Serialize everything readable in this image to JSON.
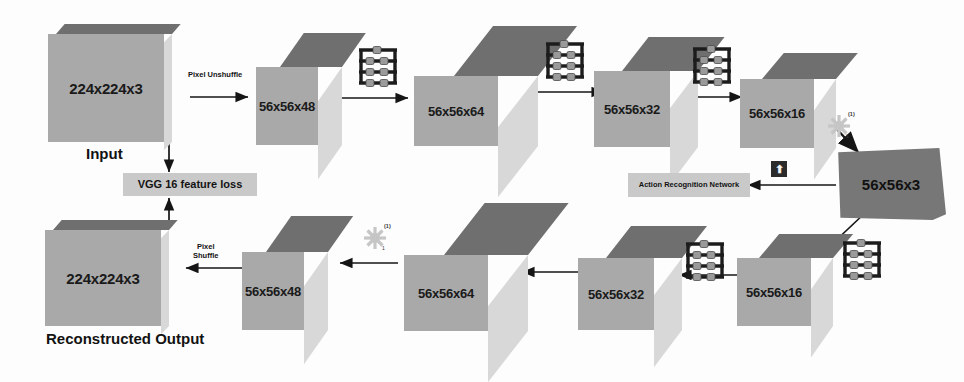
{
  "diagram": {
    "colors": {
      "cube_front": "#a9a9a9",
      "cube_top": "#6f6f6f",
      "cube_side": "#d8d8d8",
      "plate_fill": "#777777",
      "label_fill": "#c9c9c9",
      "ink": "#121212",
      "page": "#fdfdfd"
    },
    "encoder_row": {
      "blocks": [
        {
          "label": "224x224x3",
          "caption": "Input"
        },
        {
          "label": "56x56x48"
        },
        {
          "label": "56x56x64"
        },
        {
          "label": "56x56x32"
        },
        {
          "label": "56x56x16"
        }
      ],
      "edge_labels": [
        "Pixel Unshuffle"
      ]
    },
    "bottleneck": {
      "label": "56x56x3"
    },
    "decoder_row": {
      "blocks": [
        {
          "label": "56x56x16"
        },
        {
          "label": "56x56x32"
        },
        {
          "label": "56x56x64"
        },
        {
          "label": "56x56x48"
        },
        {
          "label": "224x224x3",
          "caption": "Reconstructed Output"
        }
      ],
      "edge_labels": [
        "Pixel\nShuffle"
      ]
    },
    "side_modules": {
      "loss_label": "VGG 16 feature loss",
      "action_network_label": "Action Recognition Network",
      "up_arrow_glyph": "⬆"
    },
    "icon_names": {
      "layer": "abacus-layer-icon",
      "activation": "sun-flare-activation-icon",
      "feed": "up-arrow-chip-icon"
    }
  }
}
